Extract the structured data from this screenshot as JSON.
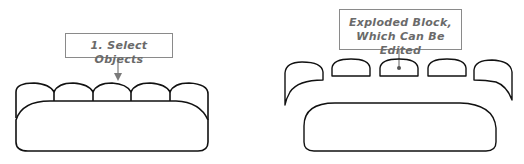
{
  "left_figure": {
    "callout": "1. Select Objects",
    "cushion_count": 5,
    "description": "Sofa block before exploding"
  },
  "right_figure": {
    "callout_lines": [
      "Exploded Block,",
      "Which Can Be Edited"
    ],
    "piece_count": 7,
    "description": "Sofa block after exploding into separate pieces"
  },
  "colors": {
    "outline": "#111111",
    "callout_border": "#8a8a8a",
    "callout_text": "#6a6a6a",
    "leader": "#7a7a7a"
  }
}
